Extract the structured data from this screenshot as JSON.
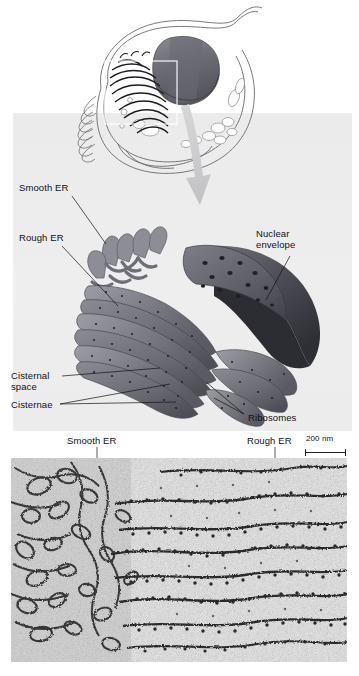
{
  "figure": {
    "type": "endoplasmic-reticulum-diagram",
    "background_color": "#ffffff",
    "panel_color": "#ececed"
  },
  "labels": {
    "smooth_er_top": "Smooth ER",
    "rough_er_top": "Rough ER",
    "nuclear_envelope_line1": "Nuclear",
    "nuclear_envelope_line2": "envelope",
    "cisternal_line1": "Cisternal",
    "cisternal_line2": "space",
    "cisternae": "Cisternae",
    "ribosomes": "Ribosomes",
    "smooth_er_micrograph": "Smooth ER",
    "rough_er_micrograph": "Rough ER",
    "scale_bar": "200 nm"
  },
  "colors": {
    "label_text": "#111111",
    "leader_line": "#111111",
    "membrane_dark": "#3d3d42",
    "membrane_mid": "#6e6e76",
    "membrane_light": "#9a9aa2",
    "nucleus": "#5c5c64",
    "arrow": "#c9c9cb",
    "cell_outline": "#5a5a5e",
    "scale_bar": "#222222"
  },
  "cell_overview": {
    "name": "whole-cell-inset",
    "highlight_box": "ER region outlined in white rectangle"
  },
  "micrograph": {
    "name": "tem-micrograph-er",
    "technique": "TEM",
    "scale_bar_length_nm": 200
  }
}
